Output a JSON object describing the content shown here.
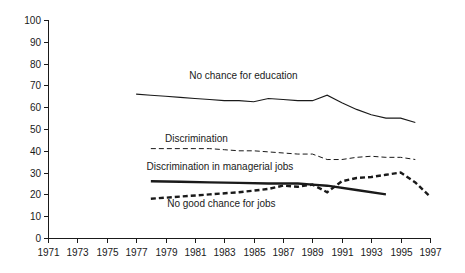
{
  "chart_data": {
    "type": "line",
    "title": "",
    "subtitle": "",
    "xlabel": "",
    "ylabel": "",
    "xlim": [
      1971,
      1997
    ],
    "ylim": [
      0,
      100
    ],
    "grid": false,
    "legend_position": "inline-annotations",
    "y_ticks": [
      "0",
      "10",
      "20",
      "30",
      "40",
      "50",
      "60",
      "70",
      "80",
      "90",
      "100"
    ],
    "x_ticks": [
      "1971",
      "1973",
      "1975",
      "1977",
      "1979",
      "1981",
      "1983",
      "1985",
      "1987",
      "1989",
      "1991",
      "1993",
      "1995",
      "1997"
    ],
    "series": [
      {
        "name": "No chance for education",
        "style": "thin-solid",
        "color": "#1a1a1a",
        "label_x": 1984.3,
        "label_y": 73,
        "x": [
          1977,
          1978,
          1979,
          1980,
          1981,
          1982,
          1983,
          1984,
          1985,
          1986,
          1987,
          1988,
          1989,
          1990,
          1991,
          1992,
          1993,
          1994,
          1995,
          1996
        ],
        "values": [
          66,
          65.5,
          65,
          64.5,
          64,
          63.5,
          63,
          63,
          62.5,
          64,
          63.5,
          63,
          63,
          65.5,
          62,
          59,
          56.5,
          55,
          55,
          53
        ]
      },
      {
        "name": "Discrimination",
        "style": "thin-dashed",
        "color": "#1a1a1a",
        "label_x": 1981.1,
        "label_y": 44,
        "x": [
          1978,
          1979,
          1980,
          1981,
          1982,
          1983,
          1984,
          1985,
          1986,
          1987,
          1988,
          1989,
          1990,
          1991,
          1992,
          1993,
          1994,
          1995,
          1996
        ],
        "values": [
          41,
          41,
          41,
          41,
          41,
          40.5,
          40,
          40,
          39.5,
          39,
          38.5,
          38.5,
          36,
          36,
          37,
          37.5,
          37,
          37,
          36
        ]
      },
      {
        "name": "Discrimination in managerial jobs",
        "style": "thick-solid",
        "color": "#1a1a1a",
        "label_x": 1982.7,
        "label_y": 31,
        "x": [
          1978,
          1980,
          1982,
          1984,
          1986,
          1988,
          1989,
          1990,
          1992,
          1994
        ],
        "values": [
          26,
          25.8,
          25.5,
          25.3,
          25,
          25,
          24.5,
          24,
          22,
          20
        ]
      },
      {
        "name": "No good chance for jobs",
        "style": "thick-dashed",
        "color": "#1a1a1a",
        "label_x": 1982.8,
        "label_y": 14,
        "x": [
          1978,
          1980,
          1982,
          1984,
          1986,
          1987,
          1988,
          1989,
          1990,
          1991,
          1992,
          1993,
          1994,
          1995,
          1996,
          1997
        ],
        "values": [
          18,
          19,
          20,
          21,
          22.5,
          24,
          23.5,
          24.5,
          21,
          26,
          27.5,
          28,
          29,
          30,
          25.5,
          19
        ]
      }
    ]
  }
}
